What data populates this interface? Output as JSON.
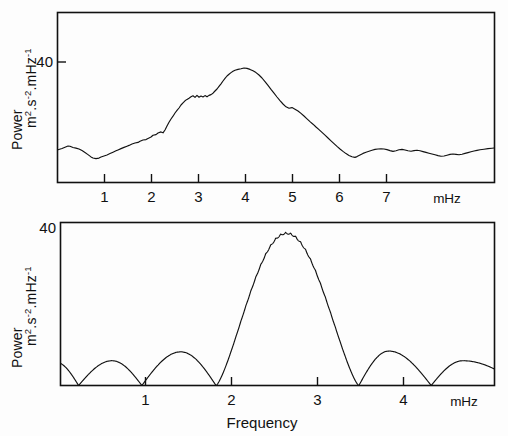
{
  "figure": {
    "background_color": "#fdfdfd",
    "ink_color": "#111111",
    "panels": [
      {
        "id": "observed-power-spectrum",
        "role": "top",
        "y_tick_label": "40",
        "y_axis_label_main": "Power",
        "y_axis_label_units_base": "m",
        "y_axis_label_units": "m2.s-2.mHz-1",
        "x_unit_label": "mHz",
        "x_tick_labels": [
          "1",
          "2",
          "3",
          "4",
          "5",
          "6",
          "7"
        ],
        "x_axis_title": ""
      },
      {
        "id": "spectral-window",
        "role": "bottom",
        "y_tick_label": "40",
        "y_axis_label_main": "Power",
        "y_axis_label_units": "m2.s-2.mHz-1",
        "x_unit_label": "mHz",
        "x_tick_labels": [
          "1",
          "2",
          "3",
          "4"
        ],
        "x_axis_title": "Frequency"
      }
    ]
  },
  "chart_data": [
    {
      "type": "line",
      "id": "observed-power-spectrum",
      "title": "",
      "xlabel": "",
      "ylabel": "Power  m^2.s^-2.mHz^-1",
      "xunit": "mHz",
      "xlim": [
        0.25,
        7.85
      ],
      "ylim": [
        0,
        56
      ],
      "yticks": [
        40
      ],
      "ytick_labels": [
        "40"
      ],
      "xticks": [
        1,
        2,
        3,
        4,
        5,
        6,
        7
      ],
      "xtick_labels": [
        "1",
        "2",
        "3",
        "4",
        "5",
        "6",
        "7"
      ],
      "grid": false,
      "legend": "none",
      "description": "Noisy observed solar oscillation power spectrum with broad five-minute band peaking near 3.7 mHz",
      "x": [
        0.25,
        0.33,
        0.41,
        0.49,
        0.57,
        0.65,
        0.73,
        0.81,
        0.89,
        0.97,
        1.05,
        1.13,
        1.21,
        1.29,
        1.37,
        1.45,
        1.53,
        1.61,
        1.69,
        1.77,
        1.85,
        1.93,
        2.01,
        2.09,
        2.17,
        2.25,
        2.33,
        2.41,
        2.49,
        2.57,
        2.65,
        2.73,
        2.81,
        2.89,
        2.97,
        3.05,
        3.13,
        3.21,
        3.29,
        3.37,
        3.45,
        3.53,
        3.61,
        3.69,
        3.77,
        3.85,
        3.93,
        4.01,
        4.09,
        4.17,
        4.25,
        4.33,
        4.41,
        4.49,
        4.57,
        4.65,
        4.73,
        4.81,
        4.89,
        4.97,
        5.05,
        5.13,
        5.21,
        5.29,
        5.37,
        5.45,
        5.53,
        5.61,
        5.69,
        5.77,
        5.85,
        5.93,
        6.01,
        6.09,
        6.17,
        6.25,
        6.33,
        6.41,
        6.49,
        6.57,
        6.65,
        6.73,
        6.81,
        6.89,
        6.97,
        7.05,
        7.13,
        7.21,
        7.29,
        7.37,
        7.45,
        7.53,
        7.61,
        7.69,
        7.77,
        7.85
      ],
      "y": [
        10.8,
        11.2,
        11.6,
        11.5,
        11.1,
        10.6,
        10.0,
        9.2,
        8.4,
        8.0,
        8.2,
        8.9,
        9.4,
        10.3,
        10.8,
        11.3,
        11.9,
        12.6,
        13.1,
        13.6,
        14.3,
        15.2,
        16.1,
        15.8,
        17.4,
        19.6,
        21.8,
        23.5,
        25.2,
        27.0,
        28.6,
        29.8,
        30.6,
        31.2,
        30.2,
        30.9,
        29.9,
        30.6,
        30.0,
        30.8,
        31.0,
        32.4,
        33.6,
        35.4,
        37.2,
        38.6,
        39.8,
        40.6,
        40.2,
        39.4,
        38.5,
        37.0,
        34.9,
        32.3,
        29.6,
        27.0,
        24.5,
        22.2,
        20.4,
        20.8,
        19.5,
        18.8,
        17.9,
        16.6,
        15.0,
        13.4,
        12.2,
        11.0,
        9.6,
        8.6,
        9.0,
        9.6,
        10.4,
        11.0,
        11.4,
        11.8,
        12.2,
        12.4,
        12.0,
        11.4,
        11.8,
        12.1,
        11.7,
        11.3,
        11.5,
        11.2,
        10.9,
        10.6,
        10.2,
        9.6,
        9.2,
        9.4,
        9.7,
        9.9,
        10.2,
        10.6
      ]
    },
    {
      "type": "line",
      "id": "spectral-window",
      "title": "",
      "xlabel": "Frequency",
      "ylabel": "Power  m^2.s^-2.mHz^-1",
      "xunit": "mHz",
      "xlim": [
        0.15,
        4.95
      ],
      "ylim": [
        0,
        42
      ],
      "yticks": [
        40
      ],
      "ytick_labels": [
        "40"
      ],
      "xticks": [
        1,
        2,
        3,
        4
      ],
      "xtick_labels": [
        "1",
        "2",
        "3",
        "4"
      ],
      "grid": false,
      "legend": "none",
      "description": "Spectral window function: central main lobe near 2.65 mHz reaching 40, with zeros near 0.35, 1.05, 1.87, 3.45 and 4.25 mHz and sidelobes of amplitude 6-9",
      "main_lobe_center": 2.65,
      "main_lobe_peak": 39.5,
      "zeros": [
        0.35,
        1.05,
        1.87,
        3.45,
        4.25
      ],
      "sidelobe_peaks": [
        {
          "x": 0.72,
          "y": 6.4
        },
        {
          "x": 1.48,
          "y": 8.7
        },
        {
          "x": 3.78,
          "y": 8.9
        },
        {
          "x": 4.6,
          "y": 6.4
        }
      ],
      "ripple_period_mHz": 0.055,
      "ripple_amplitude": 1.2
    }
  ]
}
